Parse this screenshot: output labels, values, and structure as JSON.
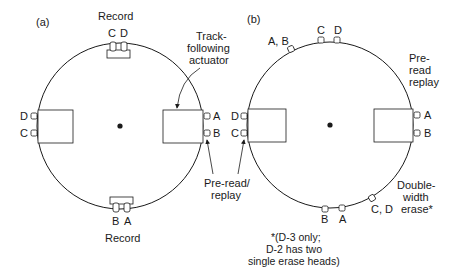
{
  "diagram": {
    "panel_a": {
      "tag": "(a)",
      "record_top_label": "Record",
      "record_top_heads": [
        "C",
        "D"
      ],
      "record_bottom_label": "Record",
      "record_bottom_heads": [
        "B",
        "A"
      ],
      "left_heads": [
        "D",
        "C"
      ],
      "right_heads": [
        "A",
        "B"
      ],
      "actuator_label_1": "Track-",
      "actuator_label_2": "following",
      "actuator_label_3": "actuator"
    },
    "shared": {
      "preread_label_1": "Pre-read/",
      "preread_label_2": "replay"
    },
    "panel_b": {
      "tag": "(b)",
      "top_left_heads": "A, B",
      "top_heads": [
        "C",
        "D"
      ],
      "preread_label_1": "Pre-",
      "preread_label_2": "read",
      "preread_label_3": "replay",
      "left_heads": [
        "D",
        "C"
      ],
      "right_heads": [
        "A",
        "B"
      ],
      "bottom_heads": [
        "B",
        "A"
      ],
      "erase_heads": "C, D",
      "erase_label_1": "Double-",
      "erase_label_2": "width",
      "erase_label_3": "erase*",
      "footnote_1": "*(D-3 only;",
      "footnote_2": "D-2 has two",
      "footnote_3": "single erase heads)"
    },
    "colors": {
      "line": "#1a1a1a",
      "background": "#ffffff"
    }
  }
}
